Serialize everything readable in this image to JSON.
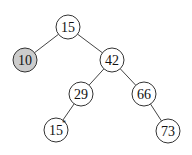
{
  "diagram": {
    "type": "binary-search-tree",
    "node_radius": 12,
    "colors": {
      "default_fill": "#ffffff",
      "highlight_fill": "#cccccc",
      "stroke": "#333333",
      "edge": "#444444"
    },
    "nodes": [
      {
        "id": "n15",
        "label": "15",
        "x": 68,
        "y": 27,
        "highlight": false,
        "mark": ""
      },
      {
        "id": "n10",
        "label": "10",
        "x": 25,
        "y": 60,
        "highlight": true,
        "mark": ""
      },
      {
        "id": "n42",
        "label": "42",
        "x": 112,
        "y": 60,
        "highlight": false,
        "mark": ""
      },
      {
        "id": "n29",
        "label": "29",
        "x": 81,
        "y": 94,
        "highlight": false,
        "mark": ""
      },
      {
        "id": "n66",
        "label": "66",
        "x": 144,
        "y": 94,
        "highlight": false,
        "mark": ""
      },
      {
        "id": "n15b",
        "label": "15",
        "x": 56,
        "y": 130,
        "highlight": false,
        "mark": "*"
      },
      {
        "id": "n73",
        "label": "73",
        "x": 168,
        "y": 131,
        "highlight": false,
        "mark": ""
      }
    ],
    "edges": [
      {
        "from": "n15",
        "to": "n10"
      },
      {
        "from": "n15",
        "to": "n42"
      },
      {
        "from": "n42",
        "to": "n29"
      },
      {
        "from": "n42",
        "to": "n66"
      },
      {
        "from": "n29",
        "to": "n15b"
      },
      {
        "from": "n66",
        "to": "n73"
      }
    ]
  }
}
